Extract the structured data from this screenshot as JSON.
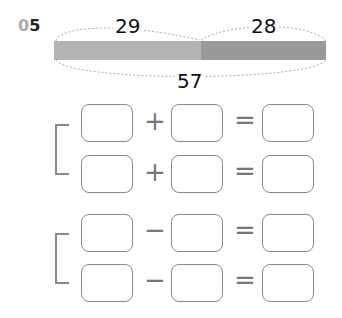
{
  "problem": {
    "number_prefix": "0",
    "number_suffix": "5"
  },
  "bar_model": {
    "left_value": "29",
    "right_value": "28",
    "total_value": "57",
    "left_color": "#b3b3b3",
    "right_color": "#999999"
  },
  "equations": {
    "addition_operator": "+",
    "subtraction_operator": "−",
    "equals": "="
  }
}
